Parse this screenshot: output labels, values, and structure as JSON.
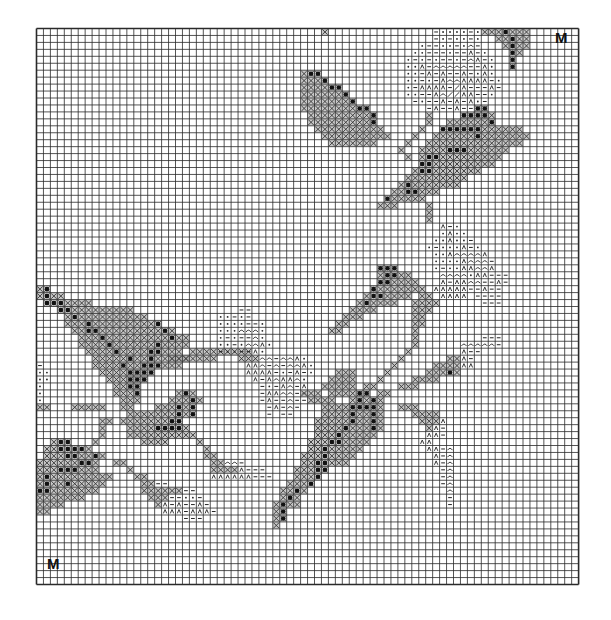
{
  "chart": {
    "title": "",
    "cols": 78,
    "rows": 80,
    "origin": {
      "x": 36.5,
      "y": 28.5
    },
    "cell": 6.95,
    "line_color": "#2a2a2a",
    "fill_color": "#9a9a9a",
    "dark_color": "#111111",
    "paper_color": "#ffffff"
  },
  "markers": [
    {
      "label": "M",
      "position": "top-right",
      "x": 555,
      "y": 30
    },
    {
      "label": "M",
      "position": "bottom-left",
      "x": 47,
      "y": 556
    }
  ],
  "legend_symbols": {
    "X": "cross-hatched stitch (medium green)",
    "O": "dark dot on cross-hatch (dark green)",
    "d": "dot symbol",
    "-": "dash symbol",
    "A": "caret symbol",
    "c": "arc symbol",
    "/": "slash symbol"
  },
  "pattern": [
    {
      "r": 0,
      "c": 41,
      "s": "X"
    },
    {
      "r": 0,
      "c": 57,
      "s": "-dddd-d"
    },
    {
      "r": 0,
      "c": 64,
      "s": "XXXOXXX"
    },
    {
      "r": 1,
      "c": 57,
      "s": "-d-dd-d"
    },
    {
      "r": 1,
      "c": 66,
      "s": "XXOXX"
    },
    {
      "r": 2,
      "c": 55,
      "s": "d--dd-dc-"
    },
    {
      "r": 2,
      "c": 67,
      "s": "XOXX"
    },
    {
      "r": 3,
      "c": 54,
      "s": "dd---d--A-d"
    },
    {
      "r": 3,
      "c": 68,
      "s": "OX"
    },
    {
      "r": 4,
      "c": 53,
      "s": "d-d-d--d-cA-d"
    },
    {
      "r": 4,
      "c": 68,
      "s": "O"
    },
    {
      "r": 5,
      "c": 53,
      "s": "ddA-ccccc--Ad"
    },
    {
      "r": 5,
      "c": 68,
      "s": "O"
    },
    {
      "r": 6,
      "c": 53,
      "s": "dd-A-A--A-dAd"
    },
    {
      "r": 6,
      "c": 38,
      "s": "XOO"
    },
    {
      "r": 7,
      "c": 38,
      "s": "XXXO"
    },
    {
      "r": 7,
      "c": 53,
      "s": "dd-d-AccAAAA-d"
    },
    {
      "r": 8,
      "c": 38,
      "s": "XXXXOO"
    },
    {
      "r": 8,
      "c": 53,
      "s": "d-AAAA-/A---A-"
    },
    {
      "r": 9,
      "c": 38,
      "s": "XXXXXXO"
    },
    {
      "r": 9,
      "c": 53,
      "s": "dd--Ac//AA--d"
    },
    {
      "r": 10,
      "c": 38,
      "s": "XXXXXXXO"
    },
    {
      "r": 10,
      "c": 54,
      "s": "-d--A-A-Ad-"
    },
    {
      "r": 11,
      "c": 38,
      "s": "XXXXXXXXOO"
    },
    {
      "r": 11,
      "c": 56,
      "s": "-A--A---"
    },
    {
      "r": 11,
      "c": 63,
      "s": "OO"
    },
    {
      "r": 12,
      "c": 39,
      "s": "XXXXXXXXXO"
    },
    {
      "r": 12,
      "c": 56,
      "s": "X"
    },
    {
      "r": 12,
      "c": 61,
      "s": "OOOOX"
    },
    {
      "r": 13,
      "c": 39,
      "s": "XXXXXXXXXO"
    },
    {
      "r": 13,
      "c": 56,
      "s": "X"
    },
    {
      "r": 13,
      "c": 59,
      "s": "XXXXXXO"
    },
    {
      "r": 14,
      "c": 40,
      "s": "XXXXXXXXXX"
    },
    {
      "r": 14,
      "c": 55,
      "s": "X"
    },
    {
      "r": 14,
      "c": 58,
      "s": "OOOOOOXXXXXX"
    },
    {
      "r": 15,
      "c": 41,
      "s": "XXXXXXXXXX"
    },
    {
      "r": 15,
      "c": 54,
      "s": "X"
    },
    {
      "r": 15,
      "c": 57,
      "s": "XXXXXXOXXXXXXX"
    },
    {
      "r": 16,
      "c": 42,
      "s": "XXXXXXX"
    },
    {
      "r": 16,
      "c": 53,
      "s": "X"
    },
    {
      "r": 16,
      "c": 56,
      "s": "XXXXXXXXXXXXXX"
    },
    {
      "r": 17,
      "c": 52,
      "s": "X"
    },
    {
      "r": 17,
      "c": 55,
      "s": "XXXXOOOXXXXXX"
    },
    {
      "r": 18,
      "c": 53,
      "s": "X"
    },
    {
      "r": 18,
      "c": 55,
      "s": "XOOXXXXXXXXX"
    },
    {
      "r": 19,
      "c": 55,
      "s": "OOXXXXXXXXX"
    },
    {
      "r": 20,
      "c": 54,
      "s": "XOOXXXXXXX"
    },
    {
      "r": 21,
      "c": 53,
      "s": "XXXXXXXXX"
    },
    {
      "r": 22,
      "c": 52,
      "s": "XOXXXXXXX"
    },
    {
      "r": 23,
      "c": 51,
      "s": "XXOOXXX"
    },
    {
      "r": 24,
      "c": 50,
      "s": "OXXXXX"
    },
    {
      "r": 25,
      "c": 49,
      "s": "XXX"
    },
    {
      "r": 25,
      "c": 56,
      "s": "X"
    },
    {
      "r": 26,
      "c": 56,
      "s": "X"
    },
    {
      "r": 27,
      "c": 56,
      "s": "X"
    },
    {
      "r": 28,
      "c": 58,
      "s": "A-d"
    },
    {
      "r": 29,
      "c": 58,
      "s": "dAdd"
    },
    {
      "r": 30,
      "c": 57,
      "s": "ddAdd-"
    },
    {
      "r": 31,
      "c": 56,
      "s": "d-dddA-d"
    },
    {
      "r": 32,
      "c": 57,
      "s": "ddAccccA"
    },
    {
      "r": 33,
      "c": 57,
      "s": "ddddAccc-"
    },
    {
      "r": 34,
      "c": 57,
      "s": "d-ddAAccA"
    },
    {
      "r": 34,
      "c": 49,
      "s": "OOO"
    },
    {
      "r": 35,
      "c": 49,
      "s": "XOOXX"
    },
    {
      "r": 35,
      "c": 58,
      "s": "ccccdAA---"
    },
    {
      "r": 36,
      "c": 49,
      "s": "OOXXXX"
    },
    {
      "r": 36,
      "c": 58,
      "s": "A-AAcc--A-"
    },
    {
      "r": 37,
      "c": 48,
      "s": "OXXXXXXX"
    },
    {
      "r": 37,
      "c": 57,
      "s": "AAAAA--A--"
    },
    {
      "r": 37,
      "c": 0,
      "s": "XO"
    },
    {
      "r": 38,
      "c": 0,
      "s": "XOXX"
    },
    {
      "r": 38,
      "c": 47,
      "s": "XOOXXXX"
    },
    {
      "r": 38,
      "c": 55,
      "s": "XX"
    },
    {
      "r": 38,
      "c": 58,
      "s": "AAAA"
    },
    {
      "r": 38,
      "c": 63,
      "s": "----"
    },
    {
      "r": 39,
      "c": 1,
      "s": "OOOXXXX"
    },
    {
      "r": 39,
      "c": 46,
      "s": "XOXXXX"
    },
    {
      "r": 39,
      "c": 54,
      "s": "XXXX"
    },
    {
      "r": 39,
      "c": 64,
      "s": "---"
    },
    {
      "r": 40,
      "c": 3,
      "s": "OOXXXXXXXXX"
    },
    {
      "r": 40,
      "c": 45,
      "s": "XXXX"
    },
    {
      "r": 40,
      "c": 54,
      "s": "XXX"
    },
    {
      "r": 40,
      "c": 30,
      "s": "-"
    },
    {
      "r": 40,
      "c": 29,
      "s": "-"
    },
    {
      "r": 41,
      "c": 4,
      "s": "XOXXXXXXXXXX"
    },
    {
      "r": 41,
      "c": 44,
      "s": "XXX"
    },
    {
      "r": 41,
      "c": 54,
      "s": "XX"
    },
    {
      "r": 41,
      "c": 26,
      "s": "dd-"
    },
    {
      "r": 41,
      "c": 29,
      "s": "d-"
    },
    {
      "r": 42,
      "c": 4,
      "s": "XXXOXXXXXXXXXO"
    },
    {
      "r": 42,
      "c": 43,
      "s": "XX"
    },
    {
      "r": 42,
      "c": 54,
      "s": "XX"
    },
    {
      "r": 42,
      "c": 26,
      "s": "dddd--d"
    },
    {
      "r": 43,
      "c": 5,
      "s": "XXOOXXXXXXXXXOX"
    },
    {
      "r": 43,
      "c": 42,
      "s": "XX"
    },
    {
      "r": 43,
      "c": 54,
      "s": "X"
    },
    {
      "r": 43,
      "c": 26,
      "s": "dddcccd"
    },
    {
      "r": 44,
      "c": 6,
      "s": "XXXOXXXXXXXXXOXX"
    },
    {
      "r": 44,
      "c": 54,
      "s": "X"
    },
    {
      "r": 44,
      "c": 26,
      "s": "d-d--cd"
    },
    {
      "r": 44,
      "c": 64,
      "s": "---"
    },
    {
      "r": 45,
      "c": 6,
      "s": "XXXXOXXXXXXOXXXX"
    },
    {
      "r": 45,
      "c": 54,
      "s": "X"
    },
    {
      "r": 45,
      "c": 26,
      "s": "dd-dccAd"
    },
    {
      "r": 45,
      "c": 61,
      "s": "ccccc-"
    },
    {
      "r": 46,
      "c": 7,
      "s": "XXXXOXXXXOOXXX"
    },
    {
      "r": 46,
      "c": 22,
      "s": "XXXXXXX"
    },
    {
      "r": 46,
      "c": 29,
      "s": "XX"
    },
    {
      "r": 46,
      "c": 53,
      "s": "X"
    },
    {
      "r": 46,
      "c": 26,
      "s": "-dd--Ad"
    },
    {
      "r": 46,
      "c": 61,
      "s": "A--"
    },
    {
      "r": 47,
      "c": 8,
      "s": "XXXXXOXXOXXXXX"
    },
    {
      "r": 47,
      "c": 19,
      "s": "XXXXXXX"
    },
    {
      "r": 47,
      "c": 29,
      "s": "XXXcc-ccAd"
    },
    {
      "r": 47,
      "c": 52,
      "s": "X"
    },
    {
      "r": 47,
      "c": 59,
      "s": "XXA-"
    },
    {
      "r": 48,
      "c": 8,
      "s": "XXXXOXXOOOXXX"
    },
    {
      "r": 48,
      "c": 30,
      "s": "AAc-c-ccAd"
    },
    {
      "r": 48,
      "c": 51,
      "s": "X"
    },
    {
      "r": 48,
      "c": 57,
      "s": "XXXXAA"
    },
    {
      "r": 48,
      "c": 0,
      "s": "-"
    },
    {
      "r": 49,
      "c": 0,
      "s": "dd"
    },
    {
      "r": 49,
      "c": 9,
      "s": "XXXXOOOO"
    },
    {
      "r": 49,
      "c": 30,
      "s": "AAAA-d-A-d"
    },
    {
      "r": 49,
      "c": 50,
      "s": "X"
    },
    {
      "r": 49,
      "c": 43,
      "s": "XXX"
    },
    {
      "r": 49,
      "c": 56,
      "s": "XXXOX"
    },
    {
      "r": 50,
      "c": 0,
      "s": "dd"
    },
    {
      "r": 50,
      "c": 10,
      "s": "XXXOOO"
    },
    {
      "r": 50,
      "c": 31,
      "s": "A-AcAAcd"
    },
    {
      "r": 50,
      "c": 42,
      "s": "XXXX"
    },
    {
      "r": 50,
      "c": 49,
      "s": "X"
    },
    {
      "r": 50,
      "c": 54,
      "s": "XXXX"
    },
    {
      "r": 51,
      "c": 0,
      "s": "d"
    },
    {
      "r": 51,
      "c": 11,
      "s": "XXOO"
    },
    {
      "r": 51,
      "c": 32,
      "s": "-d-Ac-A"
    },
    {
      "r": 51,
      "c": 41,
      "s": "XXXXX"
    },
    {
      "r": 51,
      "c": 47,
      "s": "XX"
    },
    {
      "r": 51,
      "c": 52,
      "s": "XXX"
    },
    {
      "r": 52,
      "c": 0,
      "s": "d"
    },
    {
      "r": 52,
      "c": 11,
      "s": "XXXO"
    },
    {
      "r": 52,
      "c": 20,
      "s": "XOX"
    },
    {
      "r": 52,
      "c": 32,
      "s": "-AAcc-c"
    },
    {
      "r": 52,
      "c": 38,
      "s": "XXX"
    },
    {
      "r": 52,
      "c": 42,
      "s": "XXXXOO"
    },
    {
      "r": 52,
      "c": 49,
      "s": "XX"
    },
    {
      "r": 53,
      "c": 0,
      "s": "d"
    },
    {
      "r": 53,
      "c": 12,
      "s": "XXX"
    },
    {
      "r": 53,
      "c": 19,
      "s": "XXXOX"
    },
    {
      "r": 53,
      "c": 32,
      "s": "-A--c--"
    },
    {
      "r": 53,
      "c": 39,
      "s": "XXXX"
    },
    {
      "r": 53,
      "c": 45,
      "s": "XOXOX"
    },
    {
      "r": 54,
      "c": 0,
      "s": "XX"
    },
    {
      "r": 54,
      "c": 5,
      "s": "XXXXX"
    },
    {
      "r": 54,
      "c": 12,
      "s": "XX"
    },
    {
      "r": 54,
      "c": 17,
      "s": "XXXOXO"
    },
    {
      "r": 54,
      "c": 33,
      "s": "-A-c-"
    },
    {
      "r": 54,
      "c": 41,
      "s": "XXXXOOOOX"
    },
    {
      "r": 54,
      "c": 52,
      "s": "XXX"
    },
    {
      "r": 55,
      "c": 13,
      "s": "XX"
    },
    {
      "r": 55,
      "c": 15,
      "s": "XXXXXOXO"
    },
    {
      "r": 55,
      "c": 33,
      "s": "-"
    },
    {
      "r": 55,
      "c": 35,
      "s": "--"
    },
    {
      "r": 55,
      "c": 41,
      "s": "XXXXOXXOX"
    },
    {
      "r": 55,
      "c": 54,
      "s": "XXXX"
    },
    {
      "r": 56,
      "c": 9,
      "s": "XX"
    },
    {
      "r": 56,
      "c": 12,
      "s": "XXXXXXXOO"
    },
    {
      "r": 56,
      "c": 40,
      "s": "XXXXXOXXOX"
    },
    {
      "r": 56,
      "c": 55,
      "s": "XXXA"
    },
    {
      "r": 57,
      "c": 9,
      "s": "X"
    },
    {
      "r": 57,
      "c": 13,
      "s": "XXXXOOOOX"
    },
    {
      "r": 57,
      "c": 40,
      "s": "XXXXOXXXOX"
    },
    {
      "r": 57,
      "c": 56,
      "s": "XA-"
    },
    {
      "r": 58,
      "c": 9,
      "s": "X"
    },
    {
      "r": 58,
      "c": 13,
      "s": "XXXXXXXXX"
    },
    {
      "r": 58,
      "c": 22,
      "s": "X"
    },
    {
      "r": 58,
      "c": 40,
      "s": "XXXOXXXXX"
    },
    {
      "r": 58,
      "c": 56,
      "s": "AA-"
    },
    {
      "r": 59,
      "c": 2,
      "s": "XOO"
    },
    {
      "r": 59,
      "c": 8,
      "s": "X"
    },
    {
      "r": 59,
      "c": 15,
      "s": "XXXX"
    },
    {
      "r": 59,
      "c": 23,
      "s": "X"
    },
    {
      "r": 59,
      "c": 39,
      "s": "XXXOOXXXX"
    },
    {
      "r": 59,
      "c": 55,
      "s": "AA"
    },
    {
      "r": 60,
      "c": 1,
      "s": "XXOOOOX"
    },
    {
      "r": 60,
      "c": 24,
      "s": "X"
    },
    {
      "r": 60,
      "c": 39,
      "s": "XXOXXXXX"
    },
    {
      "r": 60,
      "c": 56,
      "s": "AA-c"
    },
    {
      "r": 61,
      "c": 1,
      "s": "XXXOOXXO"
    },
    {
      "r": 61,
      "c": 9,
      "s": "X"
    },
    {
      "r": 61,
      "c": 24,
      "s": "XX"
    },
    {
      "r": 61,
      "c": 38,
      "s": "XXXOXXXX"
    },
    {
      "r": 61,
      "c": 57,
      "s": "A-c"
    },
    {
      "r": 62,
      "c": 0,
      "s": "XXXXXXOOX"
    },
    {
      "r": 62,
      "c": 11,
      "s": "XX"
    },
    {
      "r": 62,
      "c": 25,
      "s": "XXcc-"
    },
    {
      "r": 62,
      "c": 38,
      "s": "XXOOXXX"
    },
    {
      "r": 62,
      "c": 57,
      "s": "A-c"
    },
    {
      "r": 63,
      "c": 0,
      "s": "XXXOOOXXX"
    },
    {
      "r": 63,
      "c": 13,
      "s": "X"
    },
    {
      "r": 63,
      "c": 25,
      "s": "XXXXA---"
    },
    {
      "r": 63,
      "c": 37,
      "s": "XXXOO"
    },
    {
      "r": 63,
      "c": 58,
      "s": "-c"
    },
    {
      "r": 64,
      "c": 0,
      "s": "XOXXXXXXXXX"
    },
    {
      "r": 64,
      "c": 14,
      "s": "XX"
    },
    {
      "r": 64,
      "c": 25,
      "s": "AAAAAA---"
    },
    {
      "r": 64,
      "c": 37,
      "s": "XXXO"
    },
    {
      "r": 64,
      "c": 58,
      "s": "-c"
    },
    {
      "r": 65,
      "c": 0,
      "s": "XOXXOXXXXX"
    },
    {
      "r": 65,
      "c": 15,
      "s": "XX"
    },
    {
      "r": 65,
      "c": 17,
      "s": "--"
    },
    {
      "r": 65,
      "c": 36,
      "s": "XXXO"
    },
    {
      "r": 65,
      "c": 58,
      "s": "-c"
    },
    {
      "r": 66,
      "c": 0,
      "s": "OOXXXXXXX"
    },
    {
      "r": 66,
      "c": 15,
      "s": "XXXXXX--"
    },
    {
      "r": 66,
      "c": 35,
      "s": "XXOX"
    },
    {
      "r": 66,
      "c": 59,
      "s": "c"
    },
    {
      "r": 67,
      "c": 0,
      "s": "XXXXXXX"
    },
    {
      "r": 67,
      "c": 16,
      "s": "XXX--dd-"
    },
    {
      "r": 67,
      "c": 35,
      "s": "XOX"
    },
    {
      "r": 67,
      "c": 59,
      "s": "-"
    },
    {
      "r": 68,
      "c": 0,
      "s": "XXXX"
    },
    {
      "r": 68,
      "c": 17,
      "s": "XA-A--A-"
    },
    {
      "r": 68,
      "c": 34,
      "s": "XOXX"
    },
    {
      "r": 68,
      "c": 59,
      "s": "-"
    },
    {
      "r": 69,
      "c": 0,
      "s": "XX"
    },
    {
      "r": 69,
      "c": 18,
      "s": "AAA-AAA-"
    },
    {
      "r": 69,
      "c": 34,
      "s": "XO"
    },
    {
      "r": 70,
      "c": 21,
      "s": "---"
    },
    {
      "r": 70,
      "c": 34,
      "s": "XO"
    },
    {
      "r": 71,
      "c": 34,
      "s": "X"
    }
  ]
}
